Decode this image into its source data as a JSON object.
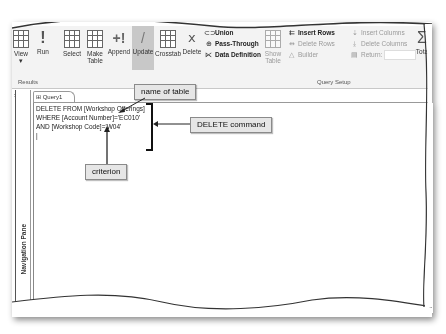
{
  "ribbon": {
    "results_group": {
      "label": "Results",
      "buttons": [
        {
          "label": "View",
          "sub": "▾",
          "icon": "datasheet-view-icon"
        },
        {
          "label": "Run",
          "icon": "run-exclamation-icon"
        }
      ]
    },
    "query_type_group": {
      "buttons": [
        {
          "label": "Select",
          "icon": "select-query-icon"
        },
        {
          "label": "Make",
          "label2": "Table",
          "icon": "make-table-icon"
        },
        {
          "label": "Append",
          "icon": "append-icon"
        },
        {
          "label": "Update",
          "icon": "update-pencil-icon",
          "active": true
        },
        {
          "label": "Crosstab",
          "icon": "crosstab-icon"
        },
        {
          "label": "Delete",
          "icon": "delete-icon"
        }
      ],
      "small_items": [
        {
          "label": "Union",
          "icon": "union-icon"
        },
        {
          "label": "Pass-Through",
          "icon": "globe-icon"
        },
        {
          "label": "Data Definition",
          "icon": "data-definition-icon"
        }
      ]
    },
    "query_setup_group": {
      "label": "Query Setup",
      "show_table": {
        "label": "Show",
        "label2": "Table"
      },
      "small_items": [
        {
          "label": "Insert Rows",
          "enabled": true
        },
        {
          "label": "Delete Rows",
          "enabled": false
        },
        {
          "label": "Builder",
          "enabled": false
        },
        {
          "label": "Insert Columns",
          "enabled": false
        },
        {
          "label": "Delete Columns",
          "enabled": false
        },
        {
          "label": "Return:",
          "enabled": false
        }
      ]
    },
    "totals": {
      "label": "Tota",
      "icon": "sigma-icon"
    }
  },
  "document_tab": {
    "label": "Query1"
  },
  "navigation_pane": {
    "label": "Navigation Pane"
  },
  "editor": {
    "lines": [
      "DELETE FROM [Workshop Offerings]",
      "WHERE [Account Number]='EC010'",
      "AND [Workshop Code]='W04'"
    ]
  },
  "callouts": {
    "name_of_table": "name of table",
    "delete_command": "DELETE command",
    "criterion": "criterion"
  }
}
